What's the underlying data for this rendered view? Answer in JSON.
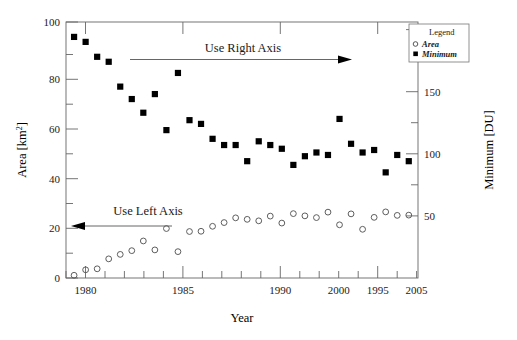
{
  "figure": {
    "xlabel": "Year",
    "ylabel_left": "Area",
    "ylabel_left_unit": "[km",
    "ylabel_left_sup": "2",
    "ylabel_left_close": "]",
    "ylabel_right": "Minimum  [DU]",
    "origin_label": "0"
  },
  "legend": {
    "title": "Legend",
    "entries": [
      {
        "label": "Area",
        "marker": "open-circle"
      },
      {
        "label": "Minimum",
        "marker": "filled-square"
      }
    ]
  },
  "annotations": [
    {
      "name": "use-right-axis",
      "text": "Use Right Axis",
      "arrow": "right"
    },
    {
      "name": "use-left-axis",
      "text": "Use Left Axis",
      "arrow": "left"
    }
  ],
  "axes": {
    "x_ticks": [
      "1980",
      "1985",
      "1990",
      "1995",
      "2000",
      "2005"
    ],
    "x_tick_values": [
      1980,
      1985,
      1990,
      1995,
      2000,
      2005
    ],
    "x_range": [
      1978.3,
      2008.8
    ],
    "y_left_ticks": [
      "20",
      "40",
      "60",
      "80",
      "100"
    ],
    "y_left_tick_values": [
      20,
      40,
      60,
      80,
      100
    ],
    "y_left_range": [
      0,
      103
    ],
    "y_right_ticks": [
      "50",
      "100",
      "150",
      "200"
    ],
    "y_right_tick_values": [
      50,
      100,
      150,
      200
    ],
    "y_right_range": [
      0,
      206
    ],
    "grid": false
  },
  "chart_data": {
    "type": "scatter",
    "title": "",
    "xlabel": "Year",
    "ylabel": "Area  [km^2]",
    "y2label": "Minimum  [DU]",
    "xlim": [
      1978.3,
      2008.8
    ],
    "ylim": [
      0,
      103
    ],
    "y2lim": [
      0,
      206
    ],
    "grid": false,
    "legend": "upper right",
    "series": [
      {
        "name": "Minimum",
        "axis": "right",
        "unit": "DU",
        "marker": "filled-square",
        "color": "#000000",
        "x": [
          1979,
          1980,
          1981,
          1982,
          1983,
          1984,
          1985,
          1986,
          1987,
          1988,
          1989,
          1990,
          1991,
          1992,
          1993,
          1994,
          1995,
          1996,
          1997,
          1998,
          1999,
          2000,
          2001,
          2002,
          2003,
          2004,
          2005,
          2006,
          2007,
          2008
        ],
        "values": [
          194,
          190,
          178,
          174,
          154,
          144,
          133,
          148,
          119,
          165,
          127,
          124,
          112,
          107,
          107,
          94,
          110,
          107,
          104,
          91,
          98,
          101,
          99,
          128,
          108,
          101,
          103,
          85,
          99,
          94
        ]
      },
      {
        "name": "Area",
        "axis": "left",
        "unit": "km^2",
        "marker": "open-circle",
        "color": "#555555",
        "x": [
          1979,
          1980,
          1981,
          1982,
          1983,
          1984,
          1985,
          1986,
          1987,
          1988,
          1989,
          1990,
          1991,
          1992,
          1993,
          1994,
          1995,
          1996,
          1997,
          1998,
          1999,
          2000,
          2001,
          2002,
          2003,
          2004,
          2005,
          2006,
          2007,
          2008
        ],
        "values": [
          1.1,
          3.3,
          3.7,
          7.7,
          9.5,
          11.0,
          14.9,
          11.3,
          19.9,
          10.6,
          18.7,
          18.8,
          20.8,
          22.3,
          24.2,
          23.6,
          23.0,
          24.9,
          22.1,
          25.9,
          25.0,
          24.3,
          26.5,
          21.4,
          25.8,
          19.6,
          24.4,
          26.6,
          25.2,
          25.3
        ]
      }
    ]
  }
}
